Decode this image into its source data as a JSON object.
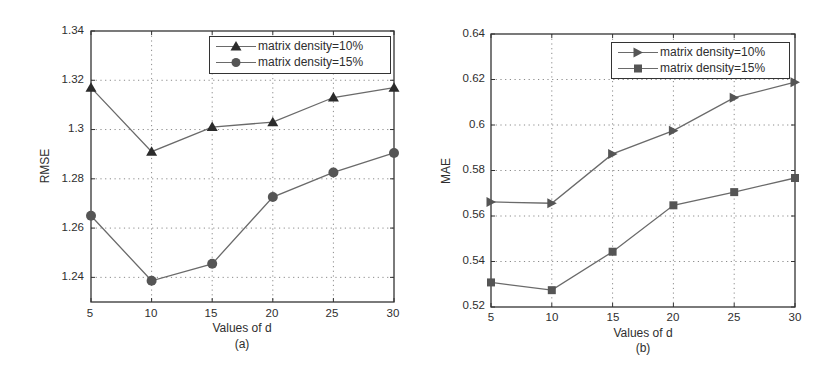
{
  "chart_data": [
    {
      "id": "a",
      "type": "line",
      "caption": "(a)",
      "title": "",
      "xlabel": "Values of d",
      "ylabel": "RMSE",
      "x": [
        5,
        10,
        15,
        20,
        25,
        30
      ],
      "xticks": [
        "5",
        "10",
        "15",
        "20",
        "25",
        "30"
      ],
      "xlim": [
        5,
        30
      ],
      "ylim": [
        1.23,
        1.34
      ],
      "yticks": [
        1.24,
        1.26,
        1.28,
        1.3,
        1.32,
        1.34
      ],
      "ytick_labels": [
        "1.24",
        "1.26",
        "1.28",
        "1.3",
        "1.32",
        "1.34"
      ],
      "grid": true,
      "legend_position": "upper right",
      "series": [
        {
          "name": "matrix density=10%",
          "marker": "triangle-up",
          "values": [
            1.317,
            1.291,
            1.301,
            1.303,
            1.313,
            1.317
          ]
        },
        {
          "name": "matrix density=15%",
          "marker": "circle",
          "values": [
            1.265,
            1.2386,
            1.2455,
            1.2726,
            1.2826,
            1.2905
          ]
        }
      ]
    },
    {
      "id": "b",
      "type": "line",
      "caption": "(b)",
      "title": "",
      "xlabel": "Values of d",
      "ylabel": "MAE",
      "x": [
        5,
        10,
        15,
        20,
        25,
        30
      ],
      "xticks": [
        "5",
        "10",
        "15",
        "20",
        "25",
        "30"
      ],
      "xlim": [
        5,
        30
      ],
      "ylim": [
        0.52,
        0.64
      ],
      "yticks": [
        0.52,
        0.54,
        0.56,
        0.58,
        0.6,
        0.62,
        0.64
      ],
      "ytick_labels": [
        "0.52",
        "0.54",
        "0.56",
        "0.58",
        "0.6",
        "0.62",
        "0.64"
      ],
      "grid": true,
      "legend_position": "upper right",
      "series": [
        {
          "name": "matrix density=10%",
          "marker": "triangle-right",
          "values": [
            0.5662,
            0.5656,
            0.5873,
            0.5975,
            0.612,
            0.6188
          ]
        },
        {
          "name": "matrix density=15%",
          "marker": "square",
          "values": [
            0.5308,
            0.5274,
            0.5443,
            0.5647,
            0.5705,
            0.5767
          ]
        }
      ]
    }
  ],
  "figures": {
    "a": {
      "xlabel": "Values of d",
      "ylabel": "RMSE",
      "caption": "(a)",
      "legend": [
        "matrix density=10%",
        "matrix density=15%"
      ],
      "xticks": [
        "5",
        "10",
        "15",
        "20",
        "25",
        "30"
      ],
      "yticks": [
        "1.24",
        "1.26",
        "1.28",
        "1.3",
        "1.32",
        "1.34"
      ]
    },
    "b": {
      "xlabel": "Values of d",
      "ylabel": "MAE",
      "caption": "(b)",
      "legend": [
        "matrix density=10%",
        "matrix density=15%"
      ],
      "xticks": [
        "5",
        "10",
        "15",
        "20",
        "25",
        "30"
      ],
      "yticks": [
        "0.52",
        "0.54",
        "0.56",
        "0.58",
        "0.6",
        "0.62",
        "0.64"
      ]
    }
  },
  "colors": {
    "axis": "#333333",
    "line": "#6a6a6a",
    "marker_10": "#2b2b2b",
    "marker_15": "#555555",
    "grid": "#8a8a8a"
  }
}
